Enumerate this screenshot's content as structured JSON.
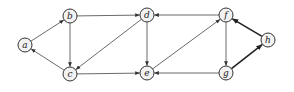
{
  "diagram": {
    "type": "directed-graph",
    "nodes": [
      {
        "id": "a",
        "label": "a",
        "x": 25,
        "y": 45
      },
      {
        "id": "b",
        "label": "b",
        "x": 70,
        "y": 16
      },
      {
        "id": "c",
        "label": "c",
        "x": 70,
        "y": 74
      },
      {
        "id": "d",
        "label": "d",
        "x": 147,
        "y": 15
      },
      {
        "id": "e",
        "label": "e",
        "x": 147,
        "y": 73
      },
      {
        "id": "f",
        "label": "f",
        "x": 226,
        "y": 15
      },
      {
        "id": "g",
        "label": "g",
        "x": 226,
        "y": 73
      },
      {
        "id": "h",
        "label": "h",
        "x": 268,
        "y": 40
      }
    ],
    "edges": [
      {
        "from": "a",
        "to": "b",
        "thick": false
      },
      {
        "from": "b",
        "to": "d",
        "thick": false
      },
      {
        "from": "b",
        "to": "c",
        "thick": false
      },
      {
        "from": "c",
        "to": "a",
        "thick": false
      },
      {
        "from": "d",
        "to": "c",
        "thick": false
      },
      {
        "from": "d",
        "to": "e",
        "thick": false
      },
      {
        "from": "c",
        "to": "e",
        "thick": false
      },
      {
        "from": "e",
        "to": "f",
        "thick": false
      },
      {
        "from": "f",
        "to": "d",
        "thick": false
      },
      {
        "from": "f",
        "to": "g",
        "thick": false
      },
      {
        "from": "g",
        "to": "e",
        "thick": false
      },
      {
        "from": "g",
        "to": "h",
        "thick": true
      },
      {
        "from": "h",
        "to": "f",
        "thick": true
      }
    ],
    "node_radius": 7
  }
}
